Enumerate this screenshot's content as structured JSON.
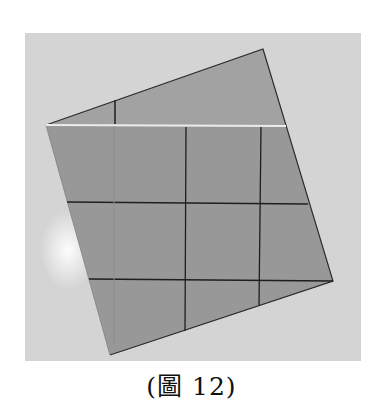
{
  "figure": {
    "caption": "(圖 12)",
    "colors": {
      "background": "#d6d6d6",
      "paper": "#9a9a9a",
      "paper_flap": "#a3a3a3",
      "lines": "#1e1e1e",
      "crease_highlight": "#e8e8e8"
    }
  }
}
